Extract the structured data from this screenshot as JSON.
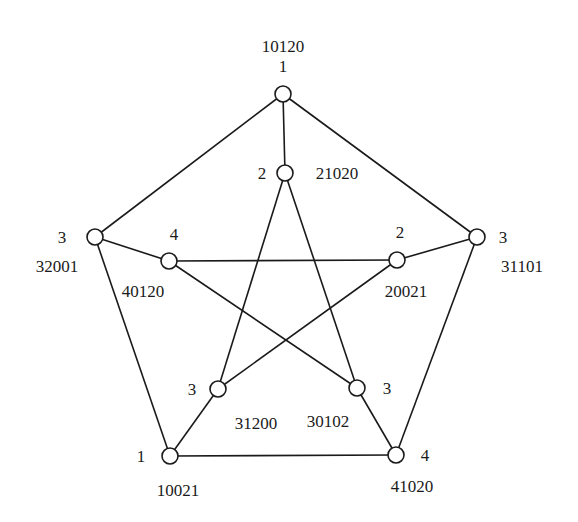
{
  "diagram": {
    "type": "graph",
    "name": "Petersen graph with vertex labels",
    "node_radius": 8,
    "nodes": [
      {
        "id": "outer_top",
        "x": 283,
        "y": 94,
        "color_label": "1",
        "code": "10120",
        "color_pos": {
          "x": 283,
          "y": 72,
          "anchor": "middle"
        },
        "code_pos": {
          "x": 283,
          "y": 52,
          "anchor": "middle"
        }
      },
      {
        "id": "outer_right",
        "x": 477,
        "y": 237,
        "color_label": "3",
        "code": "31101",
        "color_pos": {
          "x": 503,
          "y": 243,
          "anchor": "middle"
        },
        "code_pos": {
          "x": 522,
          "y": 272,
          "anchor": "middle"
        }
      },
      {
        "id": "outer_bright",
        "x": 396,
        "y": 455,
        "color_label": "4",
        "code": "41020",
        "color_pos": {
          "x": 425,
          "y": 461,
          "anchor": "middle"
        },
        "code_pos": {
          "x": 412,
          "y": 492,
          "anchor": "middle"
        }
      },
      {
        "id": "outer_bleft",
        "x": 170,
        "y": 456,
        "color_label": "1",
        "code": "10021",
        "color_pos": {
          "x": 141,
          "y": 462,
          "anchor": "middle"
        },
        "code_pos": {
          "x": 178,
          "y": 496,
          "anchor": "middle"
        }
      },
      {
        "id": "outer_left",
        "x": 95,
        "y": 237,
        "color_label": "3",
        "code": "32001",
        "color_pos": {
          "x": 62,
          "y": 243,
          "anchor": "middle"
        },
        "code_pos": {
          "x": 57,
          "y": 272,
          "anchor": "middle"
        }
      },
      {
        "id": "inner_top",
        "x": 285,
        "y": 173,
        "color_label": "2",
        "code": "21020",
        "color_pos": {
          "x": 262,
          "y": 179,
          "anchor": "middle"
        },
        "code_pos": {
          "x": 337,
          "y": 179,
          "anchor": "middle"
        }
      },
      {
        "id": "inner_right",
        "x": 397,
        "y": 260,
        "color_label": "2",
        "code": "20021",
        "color_pos": {
          "x": 400,
          "y": 238,
          "anchor": "middle"
        },
        "code_pos": {
          "x": 406,
          "y": 297,
          "anchor": "middle"
        }
      },
      {
        "id": "inner_bright",
        "x": 357,
        "y": 388,
        "color_label": "3",
        "code": "30102",
        "color_pos": {
          "x": 387,
          "y": 394,
          "anchor": "middle"
        },
        "code_pos": {
          "x": 328,
          "y": 427,
          "anchor": "middle"
        }
      },
      {
        "id": "inner_bleft",
        "x": 218,
        "y": 389,
        "color_label": "3",
        "code": "31200",
        "color_pos": {
          "x": 192,
          "y": 395,
          "anchor": "middle"
        },
        "code_pos": {
          "x": 256,
          "y": 429,
          "anchor": "middle"
        }
      },
      {
        "id": "inner_left",
        "x": 169,
        "y": 261,
        "color_label": "4",
        "code": "40120",
        "color_pos": {
          "x": 174,
          "y": 240,
          "anchor": "middle"
        },
        "code_pos": {
          "x": 143,
          "y": 297,
          "anchor": "middle"
        }
      }
    ],
    "edges": [
      [
        "outer_top",
        "outer_right"
      ],
      [
        "outer_right",
        "outer_bright"
      ],
      [
        "outer_bright",
        "outer_bleft"
      ],
      [
        "outer_bleft",
        "outer_left"
      ],
      [
        "outer_left",
        "outer_top"
      ],
      [
        "outer_top",
        "inner_top"
      ],
      [
        "outer_right",
        "inner_right"
      ],
      [
        "outer_bright",
        "inner_bright"
      ],
      [
        "outer_bleft",
        "inner_bleft"
      ],
      [
        "outer_left",
        "inner_left"
      ],
      [
        "inner_top",
        "inner_bleft"
      ],
      [
        "inner_top",
        "inner_bright"
      ],
      [
        "inner_left",
        "inner_right"
      ],
      [
        "inner_left",
        "inner_bright"
      ],
      [
        "inner_right",
        "inner_bleft"
      ]
    ],
    "colors": {
      "stroke": "#1a1a1a",
      "node_fill": "#ffffff",
      "background": "#ffffff"
    }
  }
}
